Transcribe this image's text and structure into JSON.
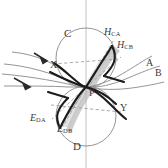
{
  "figure": {
    "title": "",
    "type": "vector-field-diagram",
    "background_color": "#ffffff",
    "colors": {
      "thin_curve": "#8a8a8a",
      "dashed_line": "#9a9a9a",
      "circle_outline": "#8f8f8f",
      "axis": "#b9b9b9",
      "heavy_curve": "#1c1c1c",
      "shaded_band": "#b5b5b5",
      "label_text": "#3a3a3a"
    },
    "labels": {
      "circle_top": "C",
      "circle_bottom": "D",
      "center_point": "P",
      "left_node": "X",
      "right_node": "Y",
      "streamline_a": "A",
      "streamline_b": "B",
      "separatrix_hca_base": "H",
      "separatrix_hca_sub": "CA",
      "separatrix_hcb_base": "H",
      "separatrix_hcb_sub": "CB",
      "separatrix_eda_base": "E",
      "separatrix_eda_sub": "DA",
      "separatrix_edb_base": "E",
      "separatrix_edb_sub": "DB"
    },
    "geometry": {
      "upper_circle": {
        "cx": 86,
        "cy": 58,
        "r": 30
      },
      "lower_circle": {
        "cx": 86,
        "cy": 116,
        "r": 30
      },
      "stagnation_point": {
        "x": 86,
        "y": 87
      },
      "vertical_axis_x": 86
    },
    "flow_arrows": [
      {
        "name": "upper-inflow-arrow",
        "direction": "down-right"
      },
      {
        "name": "lower-inflow-arrow",
        "direction": "down-right"
      }
    ]
  }
}
